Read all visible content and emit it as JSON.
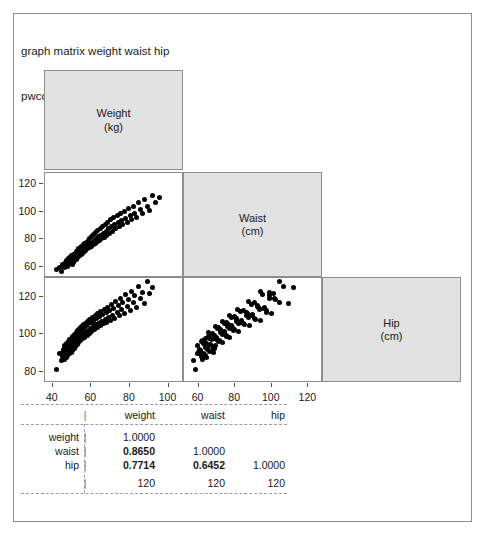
{
  "window": {
    "background": "#ffffff",
    "frame_color": "#8d8d8d"
  },
  "command_echo": {
    "line1": "graph matrix weight waist hip",
    "line2": "pwcorr weight waist hip"
  },
  "chart_data": {
    "type": "scatter",
    "title": "",
    "variables": [
      {
        "key": "weight",
        "label_line1": "Weight",
        "label_line2": "(kg)",
        "unit": "kg"
      },
      {
        "key": "waist",
        "label_line1": "Waist",
        "label_line2": "(cm)",
        "unit": "cm"
      },
      {
        "key": "hip",
        "label_line1": "Hip",
        "label_line2": "(cm)",
        "unit": "cm"
      }
    ],
    "diagonal_fill": "#e2e2e2",
    "point_color": "#000000",
    "n": 120,
    "grid": false,
    "legend": "none",
    "axes": {
      "weight": {
        "ticks": [
          40,
          60,
          80,
          100
        ],
        "min": 36,
        "max": 108
      },
      "waist": {
        "ticks": [
          60,
          80,
          100,
          120
        ],
        "min": 52,
        "max": 128
      },
      "hip": {
        "ticks": [
          80,
          100,
          120
        ],
        "min": 74,
        "max": 130
      }
    },
    "panels": [
      {
        "row": "waist",
        "col": "weight",
        "correlation": 0.865
      },
      {
        "row": "hip",
        "col": "weight",
        "correlation": 0.7714
      },
      {
        "row": "hip",
        "col": "waist",
        "correlation": 0.6452
      }
    ],
    "points": {
      "weight": [
        42.1,
        43.5,
        44.3,
        44.9,
        45.2,
        45.6,
        45.9,
        46.2,
        46.5,
        46.8,
        47.0,
        47.2,
        47.5,
        47.7,
        47.9,
        48.1,
        48.3,
        48.5,
        48.7,
        48.9,
        49.1,
        49.3,
        49.5,
        49.7,
        49.9,
        50.1,
        50.3,
        50.5,
        50.7,
        50.9,
        51.1,
        51.3,
        51.5,
        51.7,
        51.9,
        52.1,
        52.3,
        52.5,
        52.7,
        52.9,
        53.1,
        53.4,
        53.6,
        53.9,
        54.1,
        54.4,
        54.6,
        54.9,
        55.1,
        55.4,
        55.6,
        55.9,
        56.1,
        56.4,
        56.7,
        57.0,
        57.2,
        57.5,
        57.8,
        58.1,
        58.4,
        58.7,
        59.0,
        59.3,
        59.6,
        59.9,
        60.2,
        60.5,
        60.9,
        61.2,
        61.6,
        61.9,
        62.3,
        62.7,
        63.0,
        63.4,
        63.8,
        64.2,
        64.6,
        65.0,
        65.4,
        65.8,
        66.3,
        66.7,
        67.1,
        67.6,
        68.0,
        68.5,
        69.0,
        69.5,
        70.0,
        70.5,
        71.0,
        71.6,
        72.1,
        72.7,
        73.3,
        73.9,
        74.5,
        75.1,
        75.8,
        76.4,
        77.1,
        77.8,
        78.5,
        79.3,
        80.1,
        80.9,
        81.7,
        82.6,
        83.5,
        84.5,
        85.5,
        86.6,
        87.7,
        88.9,
        90.2,
        91.6,
        93.2,
        95.5
      ],
      "waist": [
        58.5,
        59.5,
        57.0,
        60.0,
        61.5,
        60.5,
        62.0,
        59.5,
        63.0,
        61.0,
        64.5,
        62.5,
        60.5,
        65.0,
        63.5,
        61.5,
        66.0,
        64.0,
        62.5,
        67.0,
        65.0,
        63.0,
        68.0,
        66.0,
        64.0,
        62.0,
        67.5,
        65.5,
        69.0,
        63.5,
        68.5,
        66.5,
        64.5,
        70.0,
        67.5,
        65.5,
        71.0,
        68.5,
        66.5,
        72.0,
        69.5,
        67.5,
        73.0,
        70.5,
        68.5,
        74.0,
        71.5,
        69.0,
        75.0,
        72.0,
        70.0,
        76.0,
        73.0,
        71.0,
        77.0,
        74.0,
        72.0,
        78.0,
        75.0,
        73.0,
        79.0,
        76.0,
        74.0,
        80.5,
        77.0,
        75.0,
        82.0,
        78.0,
        76.0,
        83.5,
        79.5,
        77.0,
        85.0,
        80.5,
        78.5,
        86.5,
        82.0,
        79.5,
        88.0,
        83.0,
        80.5,
        89.5,
        84.5,
        81.5,
        91.0,
        86.0,
        83.0,
        92.5,
        87.5,
        84.5,
        94.0,
        89.0,
        86.0,
        95.5,
        90.5,
        87.5,
        97.0,
        92.0,
        89.0,
        98.5,
        93.5,
        90.5,
        100.0,
        95.0,
        92.0,
        102.0,
        97.0,
        94.0,
        104.0,
        99.0,
        96.0,
        106.5,
        101.5,
        98.5,
        109.0,
        104.0,
        101.0,
        112.0,
        107.0,
        110.5
      ],
      "hip": [
        81.0,
        89.5,
        86.0,
        90.5,
        88.0,
        92.0,
        86.5,
        94.0,
        89.0,
        91.5,
        87.5,
        95.0,
        90.0,
        93.0,
        88.5,
        96.0,
        91.0,
        94.5,
        89.5,
        97.0,
        92.0,
        95.5,
        90.5,
        98.0,
        93.0,
        96.5,
        91.5,
        99.0,
        94.0,
        97.5,
        92.5,
        100.0,
        95.0,
        98.5,
        93.5,
        101.0,
        96.0,
        99.5,
        94.5,
        102.0,
        97.0,
        100.5,
        95.5,
        103.0,
        98.0,
        101.5,
        96.5,
        104.0,
        99.0,
        102.5,
        97.5,
        105.0,
        100.0,
        103.5,
        98.5,
        106.0,
        101.0,
        104.5,
        99.5,
        107.0,
        102.0,
        105.5,
        100.5,
        108.0,
        103.0,
        106.5,
        101.5,
        109.0,
        104.0,
        107.5,
        102.5,
        110.0,
        105.0,
        108.5,
        103.5,
        111.0,
        106.0,
        109.5,
        104.5,
        112.0,
        107.0,
        110.5,
        105.5,
        113.0,
        108.0,
        111.5,
        106.5,
        114.5,
        109.0,
        112.5,
        107.5,
        116.0,
        110.0,
        114.0,
        108.5,
        117.5,
        111.5,
        115.5,
        110.0,
        119.0,
        113.0,
        117.0,
        111.0,
        121.0,
        115.0,
        118.5,
        112.5,
        123.0,
        117.0,
        120.5,
        114.5,
        125.5,
        119.0,
        122.5,
        116.5,
        128.0,
        121.5,
        125.0
      ]
    }
  },
  "correlation_table": {
    "column_headers": [
      "weight",
      "waist",
      "hip"
    ],
    "row_labels": [
      "weight",
      "waist",
      "hip"
    ],
    "pipe": "|",
    "rows": [
      {
        "label": "weight",
        "cells": [
          "1.0000",
          "",
          ""
        ],
        "bold": [
          false,
          false,
          false
        ]
      },
      {
        "label": "waist",
        "cells": [
          "0.8650",
          "1.0000",
          ""
        ],
        "bold": [
          true,
          false,
          false
        ]
      },
      {
        "label": "hip",
        "cells": [
          "0.7714",
          "0.6452",
          "1.0000"
        ],
        "bold": [
          true,
          true,
          false
        ]
      }
    ],
    "n_row": {
      "label": "",
      "cells": [
        "120",
        "120",
        "120"
      ]
    }
  }
}
